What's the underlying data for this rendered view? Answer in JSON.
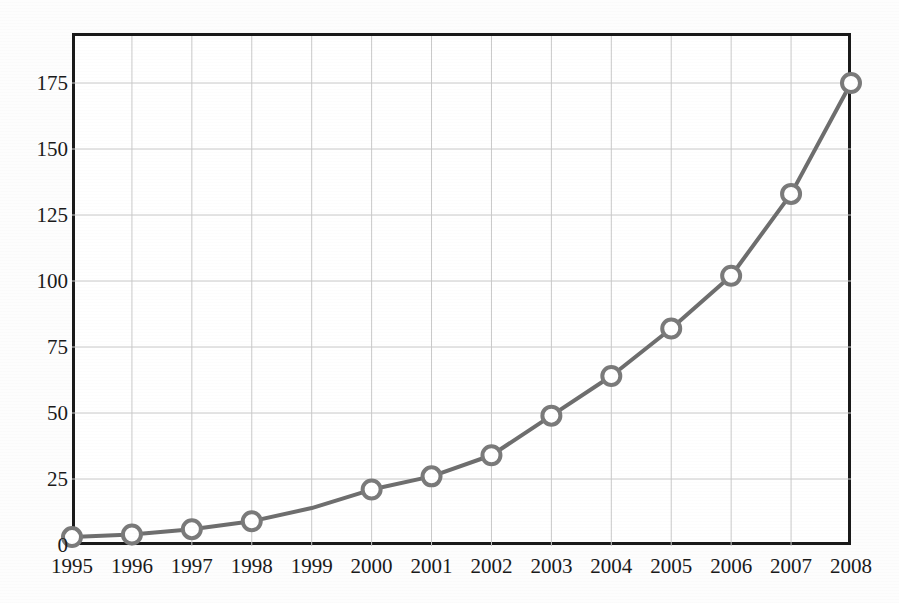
{
  "chart_data": {
    "type": "line",
    "title": "",
    "subtitle": "",
    "xlabel": "",
    "ylabel": "",
    "categories": [
      "1995",
      "1996",
      "1997",
      "1998",
      "1999",
      "2000",
      "2001",
      "2002",
      "2003",
      "2004",
      "2005",
      "2006",
      "2007",
      "2008"
    ],
    "values": [
      3,
      4,
      6,
      9,
      14,
      21,
      26,
      34,
      49,
      64,
      82,
      102,
      133,
      175
    ],
    "marker_shown": [
      true,
      true,
      true,
      true,
      false,
      true,
      true,
      true,
      true,
      true,
      true,
      true,
      true,
      true
    ],
    "series": [
      {
        "name": "series-1",
        "values": [
          3,
          4,
          6,
          9,
          14,
          21,
          26,
          34,
          49,
          64,
          82,
          102,
          133,
          175
        ]
      }
    ],
    "xlim": [
      1995,
      2008
    ],
    "ylim": [
      0,
      183
    ],
    "yticks": [
      0,
      25,
      50,
      75,
      100,
      125,
      150,
      175
    ],
    "ytick_labels": [
      "0",
      "25",
      "50",
      "75",
      "100",
      "125",
      "150",
      "175"
    ],
    "xtick_labels": [
      "1995",
      "1996",
      "1997",
      "1998",
      "1999",
      "2000",
      "2001",
      "2002",
      "2003",
      "2004",
      "2005",
      "2006",
      "2007",
      "2008"
    ],
    "grid": true,
    "grid_axes": "both",
    "legend": false,
    "legend_position": "none",
    "annotations": [],
    "colors": {
      "line": "#6e6e6e",
      "marker_stroke": "#7a7a7a",
      "marker_fill": "#ffffff",
      "grid": "#c9c9c9",
      "axis": "#1a1a1a",
      "background": "#ffffff",
      "tick_label": "#1a1a1a"
    },
    "style": {
      "line_width_px": 4,
      "marker_radius_px": 9,
      "marker_ring_width_px": 4,
      "frame_width_px": 3
    }
  },
  "axes": {
    "y_tick_0": "0",
    "y_tick_1": "25",
    "y_tick_2": "50",
    "y_tick_3": "75",
    "y_tick_4": "100",
    "y_tick_5": "125",
    "y_tick_6": "150",
    "y_tick_7": "175"
  }
}
